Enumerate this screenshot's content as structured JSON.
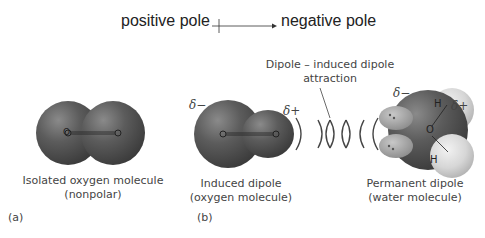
{
  "header": {
    "positive_label": "positive pole",
    "negative_label": "negative pole"
  },
  "panel_a": {
    "caption_line1": "Isolated oxygen molecule",
    "caption_line2": "(nonpolar)",
    "panel_label": "(a)",
    "atom_label_left": "O",
    "atom_label_right": "O"
  },
  "panel_b": {
    "attraction_line1": "Dipole – induced dipole",
    "attraction_line2": "attraction",
    "induced": {
      "delta_minus": "δ−",
      "delta_plus": "δ+",
      "caption_line1": "Induced dipole",
      "caption_line2": "(oxygen molecule)"
    },
    "permanent": {
      "delta_minus": "δ−",
      "delta_plus": "δ+",
      "oxygen_label": "O",
      "hydrogen_top": "H",
      "hydrogen_bottom": "H",
      "caption_line1": "Permanent dipole",
      "caption_line2": "(water molecule)"
    },
    "panel_label": "(b)"
  },
  "colors": {
    "oxygen_sphere": "#5a5a5a",
    "hydrogen_sphere": "#d8d8d8",
    "text": "#333333"
  }
}
